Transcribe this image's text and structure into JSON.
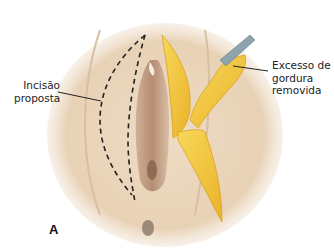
{
  "figure": {
    "panel_letter": "A",
    "labels": {
      "incision": {
        "line1": "Incisão",
        "line2": "proposta"
      },
      "fat": {
        "line1": "Excesso de",
        "line2": "gordura",
        "line3": "removida"
      }
    },
    "colors": {
      "skin": "#e9d6bd",
      "skin_shadow": "#c9a98a",
      "fat": "#f2c53a",
      "fat_edge": "#d9a21a",
      "instrument": "#8fa3ad",
      "dash": "#222222"
    }
  }
}
